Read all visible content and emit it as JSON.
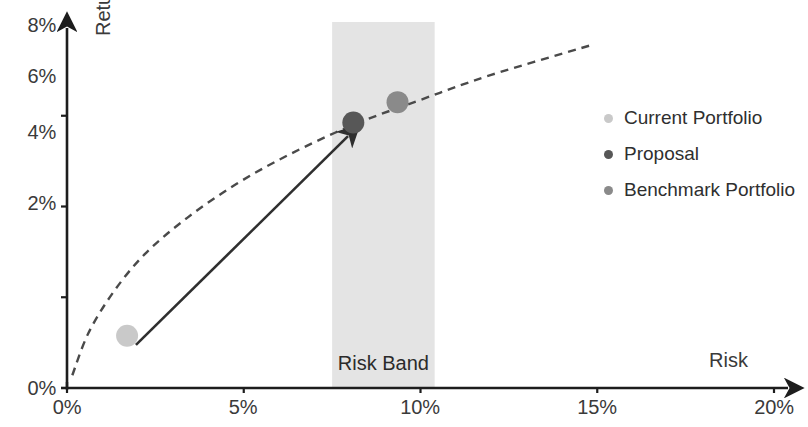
{
  "chart_data": {
    "type": "scatter",
    "title": "",
    "xlabel": "Risk",
    "ylabel": "Return",
    "xlim": [
      0,
      20
    ],
    "ylim": [
      0,
      8
    ],
    "grid": false,
    "x_ticks": [
      "0%",
      "5%",
      "10%",
      "15%",
      "20%"
    ],
    "x_tick_values": [
      0,
      5,
      10,
      15,
      20
    ],
    "y_ticks": [
      "0%",
      "2%",
      "4%",
      "6%",
      "8%"
    ],
    "y_tick_values": [
      0,
      2,
      4,
      6,
      8
    ],
    "legend_position": "right",
    "series": [
      {
        "name": "Current Portfolio",
        "color": "#c9c9c9",
        "points": [
          {
            "x": 1.7,
            "y": 1.15
          }
        ]
      },
      {
        "name": "Proposal",
        "color": "#575757",
        "points": [
          {
            "x": 8.1,
            "y": 5.85
          }
        ]
      },
      {
        "name": "Benchmark Portfolio",
        "color": "#8a8a8a",
        "points": [
          {
            "x": 9.35,
            "y": 6.3
          }
        ]
      }
    ],
    "efficient_frontier": {
      "name": "Efficient Frontier",
      "style": "dashed",
      "color": "#4a4a4a",
      "points": [
        {
          "x": 0.15,
          "y": 0.28
        },
        {
          "x": 0.6,
          "y": 1.2
        },
        {
          "x": 1.3,
          "y": 2.1
        },
        {
          "x": 2.2,
          "y": 2.95
        },
        {
          "x": 3.4,
          "y": 3.75
        },
        {
          "x": 4.8,
          "y": 4.5
        },
        {
          "x": 6.3,
          "y": 5.15
        },
        {
          "x": 8.1,
          "y": 5.8
        },
        {
          "x": 10.0,
          "y": 6.35
        },
        {
          "x": 12.0,
          "y": 6.9
        },
        {
          "x": 14.8,
          "y": 7.55
        }
      ]
    },
    "risk_band": {
      "label": "Risk Band",
      "x_start": 7.5,
      "x_end": 10.4,
      "color": "#e4e4e4"
    },
    "annotations": [
      {
        "type": "arrow",
        "label": "",
        "from": {
          "x": 1.95,
          "y": 0.95
        },
        "to": {
          "x": 7.95,
          "y": 5.55
        },
        "color": "#2f2f2f"
      }
    ]
  },
  "axes": {
    "y_title": "Return",
    "x_title": "Risk"
  },
  "legend": {
    "items": [
      {
        "label": "Current Portfolio",
        "color": "#c9c9c9"
      },
      {
        "label": "Proposal",
        "color": "#575757"
      },
      {
        "label": "Benchmark Portfolio",
        "color": "#8a8a8a"
      }
    ]
  },
  "band": {
    "label": "Risk Band"
  }
}
